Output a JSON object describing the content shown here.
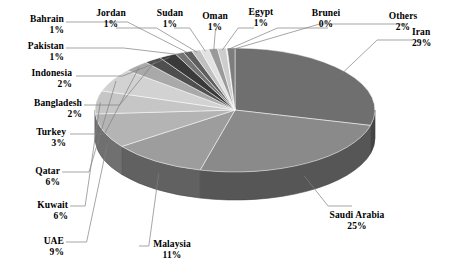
{
  "chart_data": {
    "type": "pie",
    "title": "",
    "subtitle": "",
    "xlabel": "",
    "ylabel": "",
    "legend_position": "none",
    "grid": false,
    "style": "3d-exploded-none-grayscale",
    "value_unit": "percent",
    "labels": [
      "Iran",
      "Saudi Arabia",
      "Malaysia",
      "UAE",
      "Kuwait",
      "Qatar",
      "Turkey",
      "Bangladesh",
      "Indonesia",
      "Pakistan",
      "Bahrain",
      "Jordan",
      "Sudan",
      "Oman",
      "Egypt",
      "Brunei",
      "Others"
    ],
    "values": [
      29,
      25,
      11,
      9,
      6,
      6,
      3,
      2,
      2,
      1,
      1,
      1,
      1,
      1,
      1,
      0,
      2
    ],
    "display_percents": [
      "29%",
      "25%",
      "11%",
      "9%",
      "6%",
      "6%",
      "3%",
      "2%",
      "2%",
      "1%",
      "1%",
      "1%",
      "1%",
      "1%",
      "1%",
      "0%",
      "2%"
    ],
    "colors": [
      "#6f6f6f",
      "#8a8a8a",
      "#9d9d9d",
      "#b4b4b4",
      "#c6c6c6",
      "#d2d2d2",
      "#a9a9a9",
      "#4f4f4f",
      "#3a3a3a",
      "#747474",
      "#5e5e5e",
      "#c0c0c0",
      "#e2e2e2",
      "#9a9a9a",
      "#cdcdcd",
      "#efefef",
      "#7d7d7d"
    ],
    "slices": [
      {
        "label": "Iran",
        "percent": 29,
        "display": "29%",
        "color": "#6f6f6f",
        "start_deg": 0,
        "end_deg": 104.4
      },
      {
        "label": "Saudi Arabia",
        "percent": 25,
        "display": "25%",
        "color": "#8a8a8a",
        "start_deg": 104.4,
        "end_deg": 194.4
      },
      {
        "label": "Malaysia",
        "percent": 11,
        "display": "11%",
        "color": "#9d9d9d",
        "start_deg": 194.4,
        "end_deg": 234.0
      },
      {
        "label": "UAE",
        "percent": 9,
        "display": "9%",
        "color": "#b4b4b4",
        "start_deg": 234.0,
        "end_deg": 266.4
      },
      {
        "label": "Kuwait",
        "percent": 6,
        "display": "6%",
        "color": "#c6c6c6",
        "start_deg": 266.4,
        "end_deg": 288.0
      },
      {
        "label": "Qatar",
        "percent": 6,
        "display": "6%",
        "color": "#d2d2d2",
        "start_deg": 288.0,
        "end_deg": 309.6
      },
      {
        "label": "Turkey",
        "percent": 3,
        "display": "3%",
        "color": "#a9a9a9",
        "start_deg": 309.6,
        "end_deg": 320.4
      },
      {
        "label": "Bangladesh",
        "percent": 2,
        "display": "2%",
        "color": "#4f4f4f",
        "start_deg": 320.4,
        "end_deg": 327.6
      },
      {
        "label": "Indonesia",
        "percent": 2,
        "display": "2%",
        "color": "#3a3a3a",
        "start_deg": 327.6,
        "end_deg": 334.8
      },
      {
        "label": "Pakistan",
        "percent": 1,
        "display": "1%",
        "color": "#747474",
        "start_deg": 334.8,
        "end_deg": 338.4
      },
      {
        "label": "Bahrain",
        "percent": 1,
        "display": "1%",
        "color": "#5e5e5e",
        "start_deg": 338.4,
        "end_deg": 342.0
      },
      {
        "label": "Jordan",
        "percent": 1,
        "display": "1%",
        "color": "#c0c0c0",
        "start_deg": 342.0,
        "end_deg": 345.6
      },
      {
        "label": "Sudan",
        "percent": 1,
        "display": "1%",
        "color": "#e2e2e2",
        "start_deg": 345.6,
        "end_deg": 349.2
      },
      {
        "label": "Oman",
        "percent": 1,
        "display": "1%",
        "color": "#9a9a9a",
        "start_deg": 349.2,
        "end_deg": 352.8
      },
      {
        "label": "Egypt",
        "percent": 1,
        "display": "1%",
        "color": "#cdcdcd",
        "start_deg": 352.8,
        "end_deg": 356.4
      },
      {
        "label": "Brunei",
        "percent": 0,
        "display": "0%",
        "color": "#efefef",
        "start_deg": 356.4,
        "end_deg": 356.8
      },
      {
        "label": "Others",
        "percent": 2,
        "display": "2%",
        "color": "#7d7d7d",
        "start_deg": 356.8,
        "end_deg": 360.0
      }
    ]
  },
  "labels": {
    "bahrain": {
      "name": "Bahrain",
      "percent": "1%"
    },
    "pakistan": {
      "name": "Pakistan",
      "percent": "1%"
    },
    "indonesia": {
      "name": "Indonesia",
      "percent": "2%"
    },
    "bangladesh": {
      "name": "Bangladesh",
      "percent": "2%"
    },
    "turkey": {
      "name": "Turkey",
      "percent": "3%"
    },
    "qatar": {
      "name": "Qatar",
      "percent": "6%"
    },
    "kuwait": {
      "name": "Kuwait",
      "percent": "6%"
    },
    "uae": {
      "name": "UAE",
      "percent": "9%"
    },
    "malaysia": {
      "name": "Malaysia",
      "percent": "11%"
    },
    "jordan": {
      "name": "Jordan",
      "percent": "1%"
    },
    "sudan": {
      "name": "Sudan",
      "percent": "1%"
    },
    "oman": {
      "name": "Oman",
      "percent": "1%"
    },
    "egypt": {
      "name": "Egypt",
      "percent": "1%"
    },
    "brunei": {
      "name": "Brunei",
      "percent": "0%"
    },
    "others": {
      "name": "Others",
      "percent": "2%"
    },
    "iran": {
      "name": "Iran",
      "percent": "29%"
    },
    "saudi": {
      "name": "Saudi Arabia",
      "percent": "25%"
    }
  },
  "colors": {
    "background": "#ffffff",
    "text": "#000000",
    "leader_line": "#808080"
  }
}
